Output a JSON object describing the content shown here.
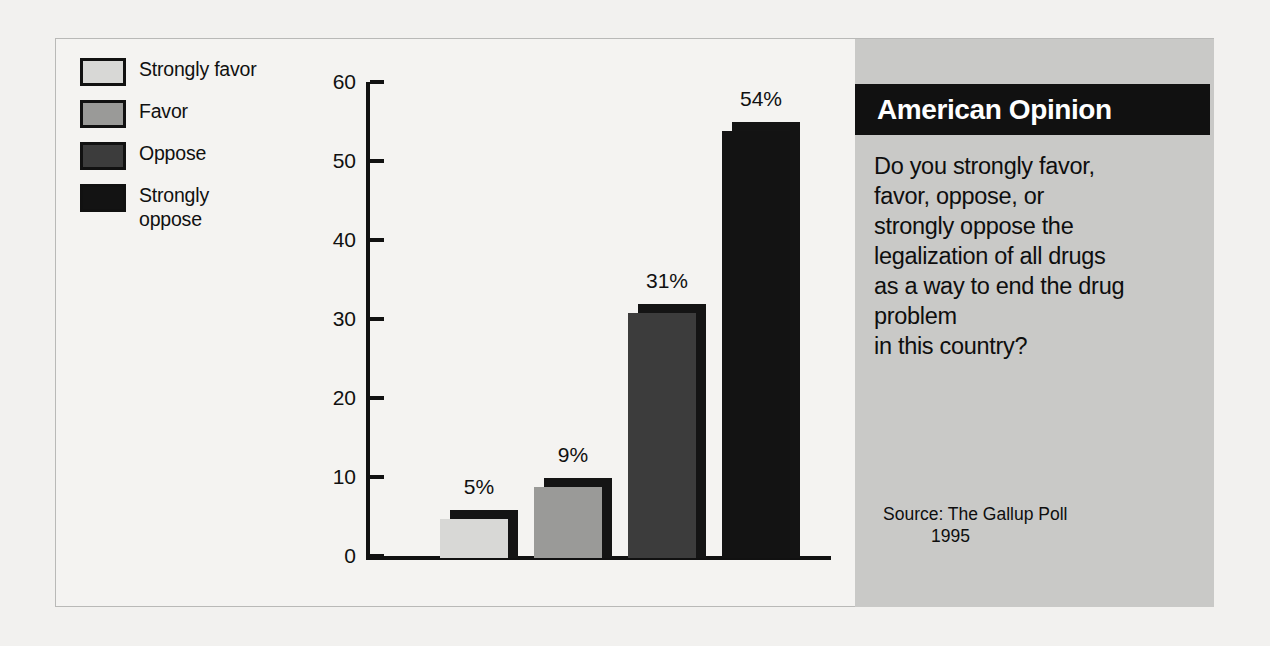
{
  "colors": {
    "background": "#f2f1ef",
    "panel_gray": "#c9c9c7",
    "header_black": "#111111",
    "header_text": "#ffffff",
    "series_strongly_favor": "#d8d8d6",
    "series_favor": "#9a9a98",
    "series_oppose": "#3c3c3c",
    "series_strongly_oppose": "#131313",
    "shadow": "#141414",
    "axis": "#111111"
  },
  "legend": {
    "items": [
      {
        "label": "Strongly favor",
        "color": "#d8d8d6",
        "icon": "legend-swatch-icon"
      },
      {
        "label": "Favor",
        "color": "#9a9a98",
        "icon": "legend-swatch-icon"
      },
      {
        "label": "Oppose",
        "color": "#3c3c3c",
        "icon": "legend-swatch-icon"
      },
      {
        "label": "Strongly\noppose",
        "color": "#131313",
        "icon": "legend-swatch-icon"
      }
    ]
  },
  "side_panel": {
    "header_title": "American Opinion",
    "question": "Do you strongly favor,\nfavor, oppose, or\nstrongly oppose the\nlegalization of all drugs\nas a way to end the drug\nproblem\nin this country?",
    "source_label": "Source:  The Gallup Poll",
    "source_year": "1995"
  },
  "chart_data": {
    "type": "bar",
    "title": "",
    "xlabel": "",
    "ylabel": "",
    "ylim": [
      0,
      60
    ],
    "yticks": [
      0,
      10,
      20,
      30,
      40,
      50,
      60
    ],
    "ytick_labels": [
      "0",
      "10",
      "20",
      "30",
      "40",
      "50",
      "60"
    ],
    "grid": false,
    "legend_position": "top-left",
    "categories": [
      "Strongly favor",
      "Favor",
      "Oppose",
      "Strongly oppose"
    ],
    "values": [
      5,
      9,
      31,
      54
    ],
    "value_labels": [
      "5%",
      "9%",
      "31%",
      "54%"
    ],
    "colors": [
      "#d8d8d6",
      "#9a9a98",
      "#3c3c3c",
      "#131313"
    ]
  }
}
